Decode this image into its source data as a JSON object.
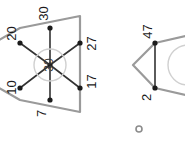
{
  "canvas": {
    "width": 185,
    "height": 145,
    "background": "#ffffff"
  },
  "palette": {
    "outline": "#9a9a9a",
    "spoke": "#333333",
    "node": "#1b1b1b",
    "hub_circle": "#cccccc",
    "label": "#1a1a1a",
    "small_dot": "#8c8c8c"
  },
  "figures": [
    {
      "id": "left-figure",
      "name": "hexagram-network-left",
      "center": {
        "x": 50,
        "y": 65
      },
      "hub_label": "30",
      "hub_radius": 16,
      "nodes": [
        {
          "id": "n-20",
          "label": "20",
          "x": 20,
          "y": 43,
          "label_x": 8,
          "label_y": 28
        },
        {
          "id": "n-30",
          "label": "30",
          "x": 50,
          "y": 28,
          "label_x": 40,
          "label_y": 8
        },
        {
          "id": "n-27",
          "label": "27",
          "x": 80,
          "y": 43,
          "label_x": 85,
          "label_y": 38
        },
        {
          "id": "n-17",
          "label": "17",
          "x": 80,
          "y": 88,
          "label_x": 85,
          "label_y": 78
        },
        {
          "id": "n-7",
          "label": "7",
          "x": 50,
          "y": 100,
          "label_x": 40,
          "label_y": 108
        },
        {
          "id": "n-10",
          "label": "10",
          "x": 20,
          "y": 88,
          "label_x": 8,
          "label_y": 82
        }
      ],
      "outline_points": "0,43 80,28 80,100 0,88",
      "triangles": [
        {
          "id": "tri-up",
          "points": "50,22 88,95 10,95"
        },
        {
          "id": "tri-down",
          "points": "50,108 10,35 88,35"
        }
      ]
    },
    {
      "id": "right-figure",
      "name": "hexagram-network-right",
      "center": {
        "x": 185,
        "y": 65
      },
      "nodes": [
        {
          "id": "n-47",
          "label": "47",
          "x": 155,
          "y": 43,
          "label_x": 143,
          "label_y": 26
        },
        {
          "id": "n-2",
          "label": "2",
          "x": 155,
          "y": 88,
          "label_x": 143,
          "label_y": 92
        }
      ],
      "outline_points": "135,65 155,43 185,43 185,88 155,88",
      "hub_arc": {
        "cx": 185,
        "cy": 65,
        "r": 20
      }
    }
  ],
  "marker": {
    "id": "small-dot",
    "name": "small-gray-dot",
    "x": 139,
    "y": 129,
    "r": 3
  }
}
